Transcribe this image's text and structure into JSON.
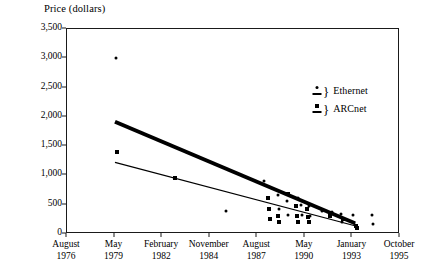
{
  "chart_data": {
    "type": "scatter",
    "title": "",
    "ylabel": "Price (dollars)",
    "xlabel": "",
    "ylim": [
      0,
      3500
    ],
    "ytick_values": [
      0,
      500,
      1000,
      1500,
      2000,
      2500,
      3000,
      3500
    ],
    "ytick_labels": [
      "0",
      "500",
      "1,000",
      "1,500",
      "2,000",
      "2,500",
      "3,000",
      "3,500"
    ],
    "xtick_labels": [
      {
        "month": "August",
        "year": "1976"
      },
      {
        "month": "May",
        "year": "1979"
      },
      {
        "month": "February",
        "year": "1982"
      },
      {
        "month": "November",
        "year": "1984"
      },
      {
        "month": "August",
        "year": "1987"
      },
      {
        "month": "May",
        "year": "1990"
      },
      {
        "month": "January",
        "year": "1993"
      },
      {
        "month": "October",
        "year": "1995"
      }
    ],
    "grid": false,
    "legend_position": "upper right",
    "legend": [
      {
        "name": "Ethernet",
        "marker": "dot-over-bar"
      },
      {
        "name": "ARCnet",
        "marker": "square-over-bar"
      }
    ],
    "series": [
      {
        "name": "Ethernet",
        "marker": "dot",
        "points": [
          {
            "x": 1979.45,
            "y": 3000
          },
          {
            "x": 1985.8,
            "y": 400
          },
          {
            "x": 1987.95,
            "y": 900
          },
          {
            "x": 1988.75,
            "y": 660
          },
          {
            "x": 1988.8,
            "y": 430
          },
          {
            "x": 1989.3,
            "y": 560
          },
          {
            "x": 1989.35,
            "y": 330
          },
          {
            "x": 1989.9,
            "y": 620
          },
          {
            "x": 1990.1,
            "y": 500
          },
          {
            "x": 1990.15,
            "y": 330
          },
          {
            "x": 1990.55,
            "y": 480
          },
          {
            "x": 1990.6,
            "y": 300
          },
          {
            "x": 1991.3,
            "y": 400
          },
          {
            "x": 1991.9,
            "y": 370
          },
          {
            "x": 1992.4,
            "y": 350
          },
          {
            "x": 1992.45,
            "y": 200
          },
          {
            "x": 1993.1,
            "y": 330
          },
          {
            "x": 1993.15,
            "y": 180
          },
          {
            "x": 1994.2,
            "y": 320
          },
          {
            "x": 1994.25,
            "y": 170
          }
        ]
      },
      {
        "name": "ARCnet",
        "marker": "square",
        "points": [
          {
            "x": 1979.5,
            "y": 1400
          },
          {
            "x": 1982.85,
            "y": 950
          },
          {
            "x": 1988.2,
            "y": 620
          },
          {
            "x": 1988.25,
            "y": 430
          },
          {
            "x": 1988.3,
            "y": 250
          },
          {
            "x": 1988.75,
            "y": 300
          },
          {
            "x": 1988.8,
            "y": 200
          },
          {
            "x": 1989.35,
            "y": 680
          },
          {
            "x": 1989.8,
            "y": 480
          },
          {
            "x": 1989.85,
            "y": 300
          },
          {
            "x": 1989.9,
            "y": 200
          },
          {
            "x": 1990.45,
            "y": 430
          },
          {
            "x": 1990.5,
            "y": 290
          },
          {
            "x": 1990.55,
            "y": 210
          },
          {
            "x": 1991.75,
            "y": 300
          },
          {
            "x": 1992.5,
            "y": 260
          },
          {
            "x": 1993.25,
            "y": 130
          },
          {
            "x": 1993.3,
            "y": 110
          }
        ]
      }
    ],
    "trend_lines": [
      {
        "name": "Ethernet",
        "style": "thick",
        "x0": 1979.4,
        "y0": 1900,
        "x1": 1993.3,
        "y1": 150
      },
      {
        "name": "ARCnet",
        "style": "thin",
        "x0": 1979.4,
        "y0": 1200,
        "x1": 1993.4,
        "y1": 100
      }
    ]
  }
}
